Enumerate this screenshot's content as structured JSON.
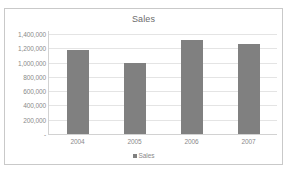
{
  "page": {
    "top_remnant_text": "··"
  },
  "chart_data": {
    "type": "bar",
    "title": "Sales",
    "xlabel": "",
    "ylabel": "",
    "categories": [
      "2004",
      "2005",
      "2006",
      "2007"
    ],
    "values": [
      1180000,
      1000000,
      1315000,
      1260000
    ],
    "series": [
      {
        "name": "Sales",
        "values": [
          1180000,
          1000000,
          1315000,
          1260000
        ]
      }
    ],
    "ylim": [
      0,
      1400000
    ],
    "ytick_values": [
      1400000,
      1200000,
      1000000,
      800000,
      600000,
      400000,
      200000,
      0
    ],
    "ytick_labels": [
      "1,400,000",
      "1,200,000",
      "1,000,000",
      "800,000",
      "600,000",
      "400,000",
      "200,000",
      "-"
    ],
    "grid": true,
    "legend": {
      "position": "bottom",
      "entries": [
        {
          "label": "Sales",
          "color": "#808080"
        }
      ]
    },
    "colors": {
      "bar": "#808080",
      "gridline": "#e4e4e4",
      "axis": "#d2d2d2",
      "text": "#8a8a8a",
      "title_text": "#6b6b6b",
      "frame_border": "#c9c9c9",
      "background": "#ffffff"
    }
  }
}
